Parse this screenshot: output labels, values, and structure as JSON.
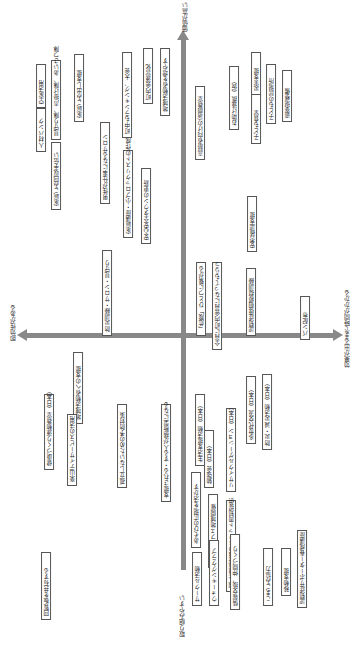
{
  "axes": {
    "top": "価値が高い",
    "bottom": "取り組みやすい",
    "left": "即効性がある",
    "right": "効果が出るまで時間がかかる"
  },
  "items": [
    {
      "label": "人材バンク",
      "x": 36,
      "y": 108,
      "h": 36
    },
    {
      "label": "空家活用",
      "x": 36,
      "y": 64,
      "h": 36
    },
    {
      "label": "見守り隊、声掛け隊、あいさつ隊",
      "x": 51,
      "y": 60,
      "h": 72
    },
    {
      "label": "家庭ごみ回収手伝い",
      "x": 51,
      "y": 142,
      "h": 60
    },
    {
      "label": "家庭ごみ出し支援",
      "x": 74,
      "y": 54,
      "h": 60
    },
    {
      "label": "町中もランキング、大会",
      "x": 122,
      "y": 52,
      "h": 78
    },
    {
      "label": "町内会運営化",
      "x": 143,
      "y": 48,
      "h": 48
    },
    {
      "label": "地域活動者を増やす",
      "x": 160,
      "y": 48,
      "h": 60
    },
    {
      "label": "男性が仕事になるサロン",
      "x": 100,
      "y": 122,
      "h": 74
    },
    {
      "label": "家庭講座・小ブロックリストの作成",
      "x": 123,
      "y": 150,
      "h": 80
    },
    {
      "label": "安心安全タウンの更新",
      "x": 141,
      "y": 168,
      "h": 68
    },
    {
      "label": "防災訓練・サロン・見守り",
      "x": 102,
      "y": 250,
      "h": 78
    },
    {
      "label": "高齢者向けの演劇教室",
      "x": 195,
      "y": 86,
      "h": 66
    },
    {
      "label": "お助け連携（仮）",
      "x": 229,
      "y": 66,
      "h": 56
    },
    {
      "label": "災害支援",
      "x": 251,
      "y": 52,
      "h": 36
    },
    {
      "label": "子ども食堂",
      "x": 251,
      "y": 94,
      "h": 42
    },
    {
      "label": "子どもの居場所",
      "x": 266,
      "y": 64,
      "h": 52
    },
    {
      "label": "遊楽場整備",
      "x": 282,
      "y": 70,
      "h": 44
    },
    {
      "label": "安否確認支援",
      "x": 247,
      "y": 196,
      "h": 48
    },
    {
      "label": "「危険」ひとつに繋がる",
      "x": 196,
      "y": 262,
      "h": 66
    },
    {
      "label": "全員に町内会員になってもらう",
      "x": 212,
      "y": 262,
      "h": 80
    },
    {
      "label": "認知症徘徊模擬訓練",
      "x": 246,
      "y": 268,
      "h": 60
    },
    {
      "label": "パン配布",
      "x": 300,
      "y": 296,
      "h": 36
    },
    {
      "label": "地域活動者への支援",
      "x": 73,
      "y": 352,
      "h": 64
    },
    {
      "label": "健康づくり運動教室（日本）",
      "x": 44,
      "y": 394,
      "h": 68
    },
    {
      "label": "楽山デイサービスの活用",
      "x": 67,
      "y": 414,
      "h": 64
    },
    {
      "label": "孤立しないための予防対策",
      "x": 117,
      "y": 404,
      "h": 76
    },
    {
      "label": "支援される・する人が横断型になる",
      "x": 161,
      "y": 404,
      "h": 90
    },
    {
      "label": "回覧板を共有する",
      "x": 41,
      "y": 552,
      "h": 60
    },
    {
      "label": "生活支援活動（日本）",
      "x": 195,
      "y": 394,
      "h": 64
    },
    {
      "label": "勉強会（日本）",
      "x": 204,
      "y": 430,
      "h": 50
    },
    {
      "label": "リサイクルゲーション（日本）",
      "x": 226,
      "y": 408,
      "h": 76
    },
    {
      "label": "多世代交流（日本）",
      "x": 246,
      "y": 376,
      "h": 60
    },
    {
      "label": "防災・減災活動（日本）",
      "x": 262,
      "y": 374,
      "h": 68
    },
    {
      "label": "あそびの広場を活かす",
      "x": 191,
      "y": 472,
      "h": 68
    },
    {
      "label": "認知症カフェ地域開催",
      "x": 208,
      "y": 494,
      "h": 66
    },
    {
      "label": "個人情報保護のメリット周知提供",
      "x": 226,
      "y": 500,
      "h": 84
    },
    {
      "label": "サークル活動",
      "x": 192,
      "y": 552,
      "h": 46
    },
    {
      "label": "ウォーキングクラブ",
      "x": 209,
      "y": 540,
      "h": 58
    },
    {
      "label": "情報交換、仲間づくり",
      "x": 230,
      "y": 534,
      "h": 68
    },
    {
      "label": "こまごみ協力",
      "x": 263,
      "y": 548,
      "h": 50
    },
    {
      "label": "移動支援",
      "x": 281,
      "y": 548,
      "h": 40
    },
    {
      "label": "認知症サポーター養成講座",
      "x": 297,
      "y": 530,
      "h": 70
    }
  ]
}
